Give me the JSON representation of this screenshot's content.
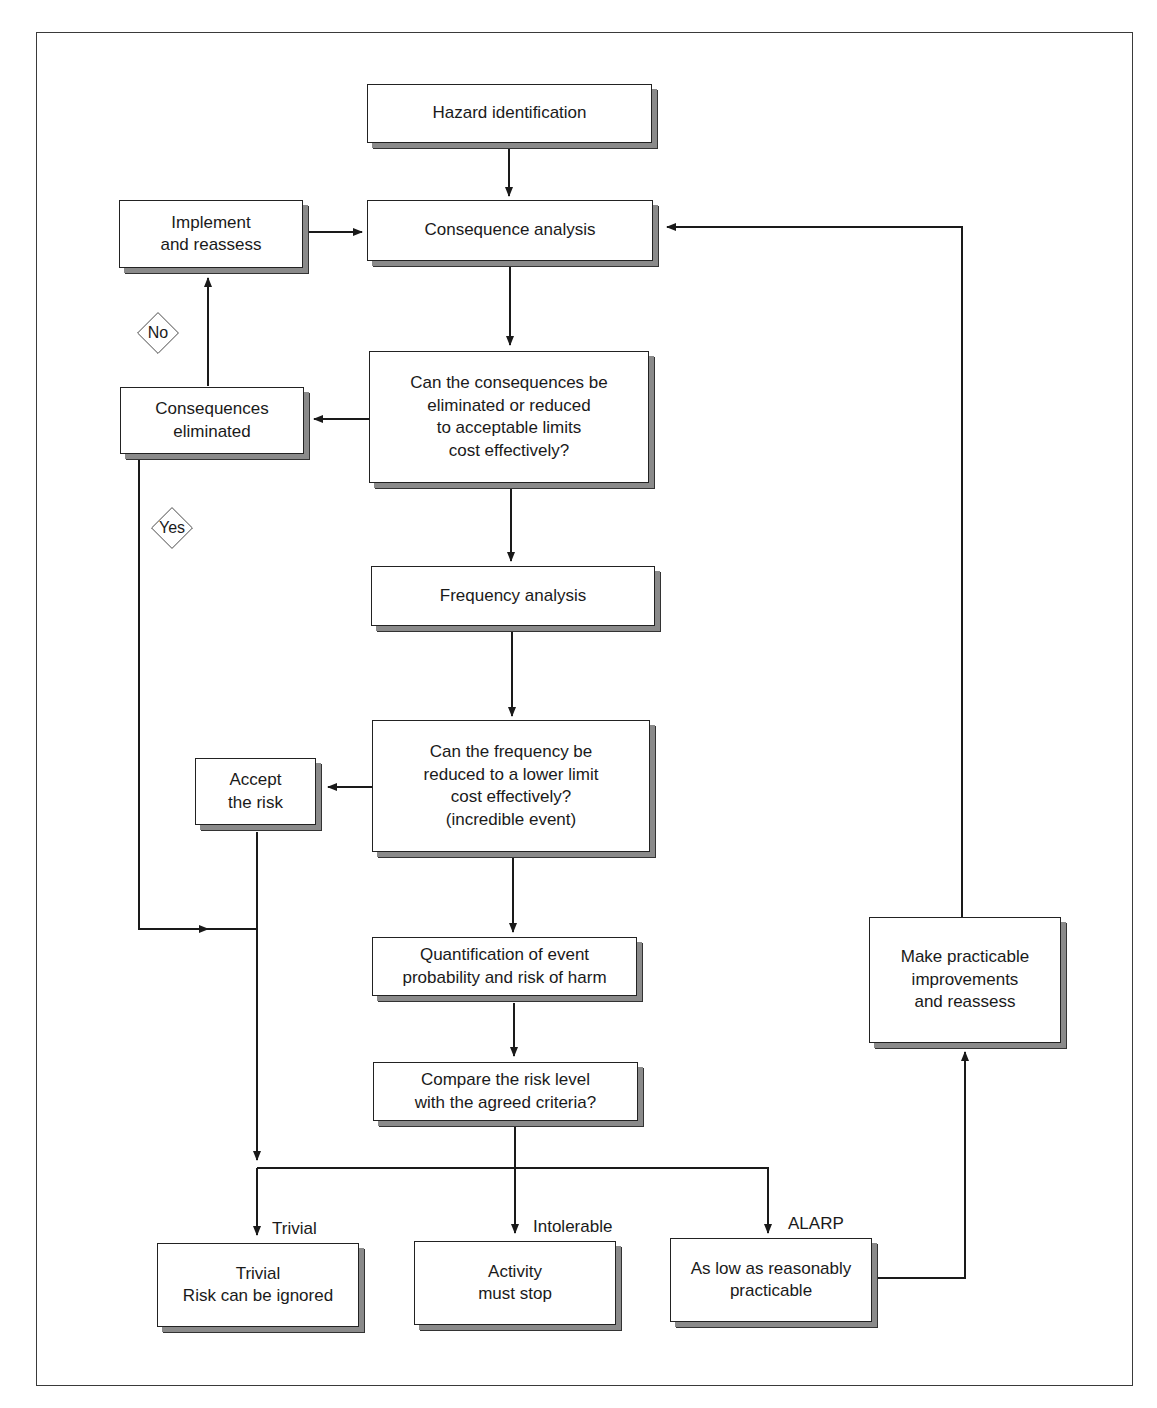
{
  "diagram": {
    "nodes": {
      "hazard": {
        "label": "Hazard identification"
      },
      "consequence": {
        "label": "Consequence analysis"
      },
      "implement": {
        "label": "Implement\nand reassess"
      },
      "consequence_question": {
        "label": "Can the consequences be\neliminated or reduced\nto acceptable limits\ncost effectively?"
      },
      "consequences_eliminated": {
        "label": "Consequences\neliminated"
      },
      "frequency": {
        "label": "Frequency analysis"
      },
      "frequency_question": {
        "label": "Can the frequency be\nreduced to a lower limit\ncost effectively?\n(incredible event)"
      },
      "accept": {
        "label": "Accept\nthe risk"
      },
      "quantification": {
        "label": "Quantification of event\nprobability and risk of harm"
      },
      "compare": {
        "label": "Compare the risk level\nwith the agreed criteria?"
      },
      "make_improvements": {
        "label": "Make practicable\nimprovements\nand reassess"
      },
      "trivial": {
        "label": "Trivial\nRisk can be ignored"
      },
      "stop": {
        "label": "Activity\nmust stop"
      },
      "alarp": {
        "label": "As low as reasonably\npracticable"
      }
    },
    "decisions": {
      "no": "No",
      "yes": "Yes"
    },
    "edge_labels": {
      "trivial": "Trivial",
      "intolerable": "Intolerable",
      "alarp": "ALARP"
    },
    "colors": {
      "line": "#1a1a1a",
      "shadow": "#8a8a8a",
      "background": "#ffffff"
    }
  }
}
